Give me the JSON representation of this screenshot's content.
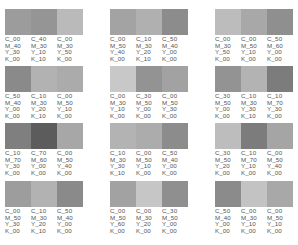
{
  "rows": [
    {
      "groups": [
        {
          "swatches": [
            {
              "color": "#9c9c9c",
              "c": "C_00",
              "m": "M_40",
              "y": "Y_30",
              "k": "K_00"
            },
            {
              "color": "#959595",
              "c": "C_40",
              "m": "M_30",
              "y": "Y_10",
              "k": "K_10"
            },
            {
              "color": "#bababa",
              "c": "C_00",
              "m": "M_30",
              "y": "Y_50",
              "k": "K_00"
            }
          ]
        },
        {
          "swatches": [
            {
              "color": "#a3a3a3",
              "c": "C_00",
              "m": "M_50",
              "y": "Y_40",
              "k": "K_00"
            },
            {
              "color": "#b0b0b0",
              "c": "C_10",
              "m": "M_30",
              "y": "Y_20",
              "k": "K_10"
            },
            {
              "color": "#8c8c8c",
              "c": "C_50",
              "m": "M_40",
              "y": "Y_00",
              "k": "K_00"
            }
          ]
        },
        {
          "swatches": [
            {
              "color": "#bcbcbc",
              "c": "C_00",
              "m": "M_30",
              "y": "Y_50",
              "k": "K_00"
            },
            {
              "color": "#a8a8a8",
              "c": "C_00",
              "m": "M_50",
              "y": "Y_10",
              "k": "K_00"
            },
            {
              "color": "#8f8f8f",
              "c": "C_50",
              "m": "M_60",
              "y": "Y_00",
              "k": "K_00"
            }
          ]
        }
      ]
    },
    {
      "groups": [
        {
          "swatches": [
            {
              "color": "#8a8a8a",
              "c": "C_50",
              "m": "M_40",
              "y": "Y_00",
              "k": "K_00"
            },
            {
              "color": "#b2b2b2",
              "c": "C_10",
              "m": "M_30",
              "y": "Y_20",
              "k": "K_10"
            },
            {
              "color": "#ababab",
              "c": "C_00",
              "m": "M_50",
              "y": "Y_10",
              "k": "K_00"
            }
          ]
        },
        {
          "swatches": [
            {
              "color": "#c8c8c8",
              "c": "C_00",
              "m": "M_30",
              "y": "Y_10",
              "k": "K_00"
            },
            {
              "color": "#939393",
              "c": "C_30",
              "m": "M_50",
              "y": "Y_00",
              "k": "K_00"
            },
            {
              "color": "#a2a2a2",
              "c": "C_00",
              "m": "M_50",
              "y": "Y_30",
              "k": "K_00"
            }
          ]
        },
        {
          "swatches": [
            {
              "color": "#939393",
              "c": "C_30",
              "m": "M_50",
              "y": "Y_00",
              "k": "K_00"
            },
            {
              "color": "#b3b3b3",
              "c": "C_10",
              "m": "M_30",
              "y": "Y_30",
              "k": "K_10"
            },
            {
              "color": "#7c7c7c",
              "c": "C_10",
              "m": "M_70",
              "y": "Y_30",
              "k": "K_00"
            }
          ]
        }
      ]
    },
    {
      "groups": [
        {
          "swatches": [
            {
              "color": "#7f7f7f",
              "c": "C_10",
              "m": "M_70",
              "y": "Y_30",
              "k": "K_00"
            },
            {
              "color": "#5c5c5c",
              "c": "C_70",
              "m": "M_60",
              "y": "Y_00",
              "k": "K_00"
            },
            {
              "color": "#a7a7a7",
              "c": "C_00",
              "m": "M_50",
              "y": "Y_40",
              "k": "K_00"
            }
          ]
        },
        {
          "swatches": [
            {
              "color": "#b3b3b3",
              "c": "C_10",
              "m": "M_30",
              "y": "Y_30",
              "k": "K_10"
            },
            {
              "color": "#acacac",
              "c": "C_00",
              "m": "M_50",
              "y": "Y_10",
              "k": "K_00"
            },
            {
              "color": "#8c8c8c",
              "c": "C_50",
              "m": "M_40",
              "y": "Y_00",
              "k": "K_00"
            }
          ]
        },
        {
          "swatches": [
            {
              "color": "#bdbdbd",
              "c": "C_30",
              "m": "M_50",
              "y": "Y_20",
              "k": "K_00"
            },
            {
              "color": "#7c7c7c",
              "c": "C_10",
              "m": "M_70",
              "y": "Y_10",
              "k": "K_00"
            },
            {
              "color": "#a5a5a5",
              "c": "C_00",
              "m": "M_50",
              "y": "Y_40",
              "k": "K_00"
            }
          ]
        }
      ]
    },
    {
      "groups": [
        {
          "swatches": [
            {
              "color": "#9d9d9d",
              "c": "C_00",
              "m": "M_50",
              "y": "Y_30",
              "k": "K_00"
            },
            {
              "color": "#b2b2b2",
              "c": "C_10",
              "m": "M_30",
              "y": "Y_20",
              "k": "K_10"
            },
            {
              "color": "#8a8a8a",
              "c": "C_50",
              "m": "M_40",
              "y": "Y_00",
              "k": "K_00"
            }
          ]
        },
        {
          "swatches": [
            {
              "color": "#a2a2a2",
              "c": "C_00",
              "m": "M_50",
              "y": "Y_60",
              "k": "K_00"
            },
            {
              "color": "#c6c6c6",
              "c": "C_00",
              "m": "M_30",
              "y": "Y_20",
              "k": "K_00"
            },
            {
              "color": "#8f8f8f",
              "c": "C_30",
              "m": "M_50",
              "y": "Y_00",
              "k": "K_00"
            }
          ]
        },
        {
          "swatches": [
            {
              "color": "#8b8b8b",
              "c": "C_50",
              "m": "M_40",
              "y": "Y_00",
              "k": "K_00"
            },
            {
              "color": "#c3c3c3",
              "c": "C_00",
              "m": "M_30",
              "y": "Y_10",
              "k": "K_00"
            },
            {
              "color": "#a8a8a8",
              "c": "C_00",
              "m": "M_50",
              "y": "Y_10",
              "k": "K_00"
            }
          ]
        }
      ]
    }
  ]
}
